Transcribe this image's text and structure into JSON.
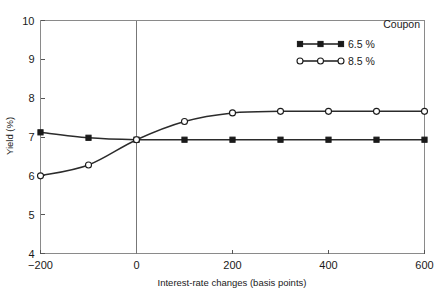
{
  "chart_data": {
    "type": "line",
    "title": "",
    "subtitle": "",
    "xlabel": "Interest-rate changes (basis points)",
    "ylabel": "Yield (%)",
    "xlim": [
      -200,
      600
    ],
    "ylim": [
      4,
      10
    ],
    "xticks": [
      -200,
      0,
      200,
      400,
      600
    ],
    "xtick_labels": [
      "−200",
      "0",
      "200",
      "400",
      "600"
    ],
    "yticks": [
      4,
      5,
      6,
      7,
      8,
      9,
      10
    ],
    "ytick_labels": [
      "4",
      "5",
      "6",
      "7",
      "8",
      "9",
      "10"
    ],
    "grid": false,
    "annotations": [
      {
        "name": "zero-reference-line",
        "type": "vline",
        "x": 0
      }
    ],
    "legend": {
      "position": "top-right",
      "title": "Coupon",
      "entries": [
        {
          "label": "6.5 %",
          "marker": "filled-square",
          "color": "#1a1a1a"
        },
        {
          "label": "8.5 %",
          "marker": "open-circle",
          "color": "#1a1a1a"
        }
      ]
    },
    "x": [
      -200,
      -100,
      0,
      100,
      200,
      300,
      400,
      500,
      600
    ],
    "series": [
      {
        "name": "6.5 %",
        "marker": "filled-square",
        "color": "#1a1a1a",
        "values": [
          7.12,
          6.98,
          6.93,
          6.93,
          6.93,
          6.93,
          6.93,
          6.93,
          6.93
        ]
      },
      {
        "name": "8.5 %",
        "marker": "open-circle",
        "color": "#1a1a1a",
        "values": [
          6.0,
          6.28,
          6.93,
          7.4,
          7.62,
          7.66,
          7.66,
          7.66,
          7.66
        ]
      }
    ]
  }
}
